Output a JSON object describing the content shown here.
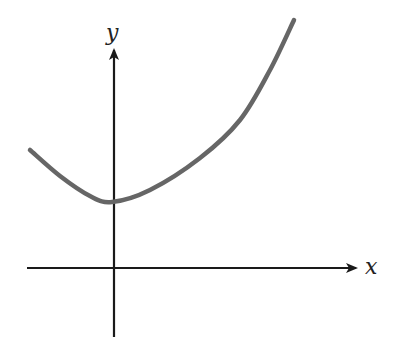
{
  "chart_data": {
    "type": "line",
    "title": "",
    "xlabel": "x",
    "ylabel": "y",
    "grid": false,
    "legend": null,
    "series": [
      {
        "name": "curve",
        "color": "#666666",
        "pixel_points": [
          [
            30,
            150
          ],
          [
            60,
            176
          ],
          [
            90,
            196
          ],
          [
            112,
            202
          ],
          [
            150,
            190
          ],
          [
            200,
            158
          ],
          [
            240,
            120
          ],
          [
            270,
            70
          ],
          [
            294,
            20
          ]
        ]
      }
    ],
    "axes": {
      "origin_px": [
        114,
        268
      ],
      "x_axis": {
        "from_px": 27,
        "to_px": 358,
        "arrow": true
      },
      "y_axis": {
        "from_px": 337,
        "to_px": 45,
        "arrow": true
      }
    },
    "colors": {
      "axis": "#1a1a1a",
      "curve": "#666666"
    }
  },
  "labels": {
    "x": "x",
    "y": "y"
  }
}
